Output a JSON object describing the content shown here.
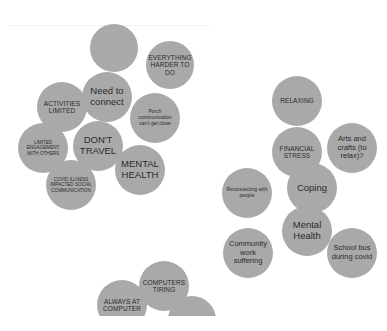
{
  "canvas": {
    "background": "#ffffff",
    "bubble_color": "#a9a9a9",
    "text_color": "#2b2b2b"
  },
  "clusters": {
    "left": {
      "bubbles": [
        {
          "id": "blank-top",
          "label": "",
          "cx": 114,
          "cy": 48,
          "r": 24,
          "style": "t-lg"
        },
        {
          "id": "need-to-connect",
          "label": "Need to connect",
          "cx": 107,
          "cy": 97,
          "r": 25,
          "style": "t-lg"
        },
        {
          "id": "everything-harder",
          "label": "EVERYTHING HARDER TO DO",
          "cx": 170,
          "cy": 65,
          "r": 24,
          "style": "t-caps"
        },
        {
          "id": "activities-limited",
          "label": "ACTIVITIES LIMITED",
          "cx": 62,
          "cy": 107,
          "r": 25,
          "style": "t-caps"
        },
        {
          "id": "porch-communication",
          "label": "Porch communication can't get close",
          "cx": 155,
          "cy": 118,
          "r": 25,
          "style": "t-tiny"
        },
        {
          "id": "limited-engagement",
          "label": "LIMITED ENGAGEMENT WITH OTHERS",
          "cx": 43,
          "cy": 148,
          "r": 25,
          "style": "t-tinycaps"
        },
        {
          "id": "dont-travel",
          "label": "DON'T TRAVEL",
          "cx": 98,
          "cy": 146,
          "r": 25,
          "style": "t-lg"
        },
        {
          "id": "mental-health-caps",
          "label": "MENTAL HEALTH",
          "cx": 140,
          "cy": 170,
          "r": 25,
          "style": "t-lg"
        },
        {
          "id": "covid-illness",
          "label": "COVID ILLNESS IMPACTED SOCIAL COMMUNICATION",
          "cx": 71,
          "cy": 185,
          "r": 25,
          "style": "t-tinycaps"
        }
      ]
    },
    "right": {
      "bubbles": [
        {
          "id": "relaxing",
          "label": "RELAXING",
          "cx": 297,
          "cy": 101,
          "r": 25,
          "style": "t-caps"
        },
        {
          "id": "financial-stress",
          "label": "FINANCIAL STRESS",
          "cx": 297,
          "cy": 152,
          "r": 25,
          "style": "t-caps"
        },
        {
          "id": "arts-and-crafts",
          "label": "Arts and crafts (to relax)?",
          "cx": 352,
          "cy": 148,
          "r": 25,
          "style": "t-md"
        },
        {
          "id": "coping",
          "label": "Coping",
          "cx": 312,
          "cy": 188,
          "r": 25,
          "style": "t-lg"
        },
        {
          "id": "reconnecting",
          "label": "Reconnecting with people",
          "cx": 247,
          "cy": 193,
          "r": 25,
          "style": "t-tiny"
        },
        {
          "id": "mental-health",
          "label": "Mental Health",
          "cx": 307,
          "cy": 231,
          "r": 25,
          "style": "t-lg"
        },
        {
          "id": "community-work",
          "label": "Community work suffering",
          "cx": 248,
          "cy": 253,
          "r": 25,
          "style": "t-md"
        },
        {
          "id": "school-bus",
          "label": "School bus during covid",
          "cx": 352,
          "cy": 253,
          "r": 25,
          "style": "t-md"
        }
      ]
    },
    "bottom": {
      "bubbles": [
        {
          "id": "computers-tiring",
          "label": "COMPUTERS TIRING",
          "cx": 164,
          "cy": 286,
          "r": 25,
          "style": "t-caps"
        },
        {
          "id": "always-at-computer",
          "label": "ALWAYS AT COMPUTER",
          "cx": 122,
          "cy": 305,
          "r": 25,
          "style": "t-caps"
        },
        {
          "id": "clipped-bottom",
          "label": "",
          "cx": 192,
          "cy": 320,
          "r": 24,
          "style": "t-caps"
        }
      ]
    }
  }
}
